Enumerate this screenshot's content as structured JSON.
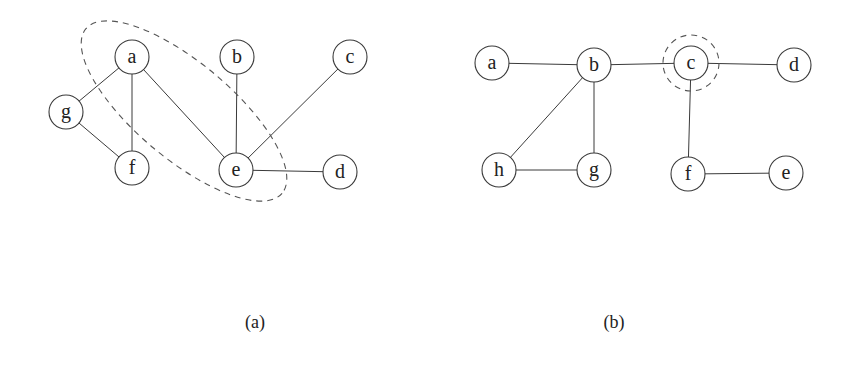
{
  "figure": {
    "panels": [
      {
        "id": "a",
        "caption": "(a)",
        "caption_pos": [
          255,
          322
        ],
        "node_radius": 17,
        "nodes": [
          {
            "id": "a",
            "label": "a",
            "x": 132,
            "y": 57
          },
          {
            "id": "b",
            "label": "b",
            "x": 237,
            "y": 57
          },
          {
            "id": "c",
            "label": "c",
            "x": 350,
            "y": 57
          },
          {
            "id": "g",
            "label": "g",
            "x": 66,
            "y": 112
          },
          {
            "id": "f",
            "label": "f",
            "x": 132,
            "y": 168
          },
          {
            "id": "e",
            "label": "e",
            "x": 236,
            "y": 170
          },
          {
            "id": "d",
            "label": "d",
            "x": 340,
            "y": 172
          }
        ],
        "edges": [
          [
            "a",
            "g"
          ],
          [
            "a",
            "f"
          ],
          [
            "a",
            "e"
          ],
          [
            "g",
            "f"
          ],
          [
            "b",
            "e"
          ],
          [
            "c",
            "e"
          ],
          [
            "e",
            "d"
          ]
        ],
        "highlight": {
          "shape": "ellipse",
          "cx": 184,
          "cy": 111,
          "rx": 128,
          "ry": 48,
          "rotate": 40,
          "encloses": [
            "a",
            "e"
          ]
        }
      },
      {
        "id": "b",
        "caption": "(b)",
        "caption_pos": [
          614,
          322
        ],
        "node_radius": 17,
        "nodes": [
          {
            "id": "a",
            "label": "a",
            "x": 492,
            "y": 63
          },
          {
            "id": "b",
            "label": "b",
            "x": 594,
            "y": 65
          },
          {
            "id": "c",
            "label": "c",
            "x": 691,
            "y": 63
          },
          {
            "id": "d",
            "label": "d",
            "x": 794,
            "y": 65
          },
          {
            "id": "h",
            "label": "h",
            "x": 499,
            "y": 170
          },
          {
            "id": "g",
            "label": "g",
            "x": 594,
            "y": 170
          },
          {
            "id": "f",
            "label": "f",
            "x": 688,
            "y": 174
          },
          {
            "id": "e",
            "label": "e",
            "x": 786,
            "y": 173
          }
        ],
        "edges": [
          [
            "a",
            "b"
          ],
          [
            "b",
            "c"
          ],
          [
            "c",
            "d"
          ],
          [
            "b",
            "h"
          ],
          [
            "b",
            "g"
          ],
          [
            "h",
            "g"
          ],
          [
            "c",
            "f"
          ],
          [
            "f",
            "e"
          ]
        ],
        "highlight": {
          "shape": "circle",
          "cx": 691,
          "cy": 63,
          "r": 28,
          "encloses": [
            "c"
          ]
        }
      }
    ]
  }
}
